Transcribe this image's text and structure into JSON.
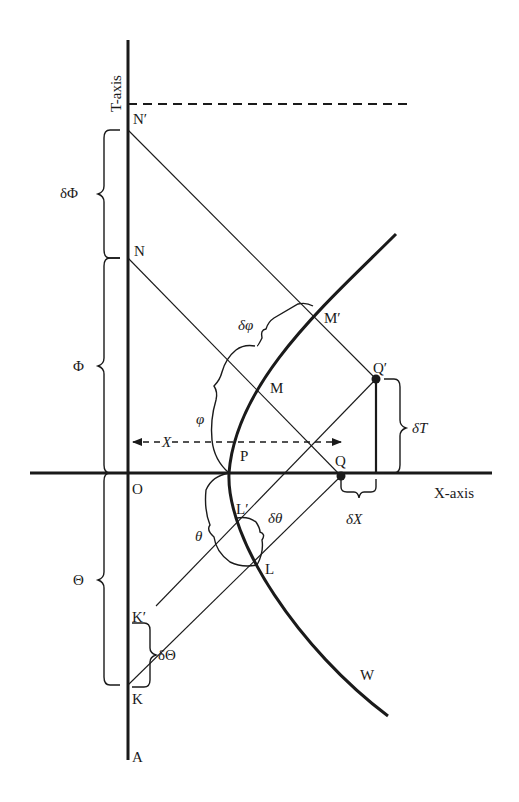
{
  "diagram": {
    "axes": {
      "t_axis_label": "T-axis",
      "x_axis_label": "X-axis"
    },
    "points": {
      "N_prime": "N′",
      "N": "N",
      "M_prime": "M′",
      "M": "M",
      "P": "P",
      "O": "O",
      "Q": "Q",
      "Q_prime": "Q′",
      "L_prime": "L′",
      "L": "L",
      "K_prime": "K′",
      "K": "K",
      "A": "A",
      "W": "W"
    },
    "braces": {
      "delta_Phi": "δΦ",
      "Phi": "Φ",
      "Theta": "Θ",
      "delta_Theta": "δΘ",
      "delta_phi": "δφ",
      "phi": "φ",
      "theta": "θ",
      "delta_theta": "δθ",
      "delta_T": "δT",
      "delta_X": "δX"
    },
    "dimension": {
      "X": "X"
    }
  }
}
